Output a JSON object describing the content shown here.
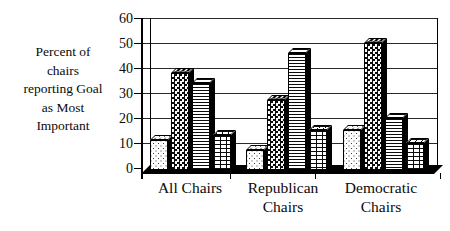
{
  "page": {
    "background": "#ffffff",
    "ink": "#000000"
  },
  "chart_data": {
    "type": "bar",
    "title": "",
    "ylabel": "Percent of chairs reporting Goal as Most Important",
    "ylabel_display": "Percent of\nchairs\nreporting Goal\nas Most\nImportant",
    "xlabel": "",
    "categories": [
      "All Chairs",
      "Republican Chairs",
      "Democratic Chairs"
    ],
    "category_display": [
      "All Chairs",
      "Republican\nChairs",
      "Democratic\nChairs"
    ],
    "series": [
      {
        "name": "dotted-pattern-bar",
        "pattern": "dots",
        "values": [
          12,
          8,
          16
        ]
      },
      {
        "name": "checkerboard-pattern-bar",
        "pattern": "checker",
        "values": [
          39,
          28,
          51
        ]
      },
      {
        "name": "horizontal-lines-pattern-bar",
        "pattern": "hlines",
        "values": [
          35,
          47,
          21
        ]
      },
      {
        "name": "brick-pattern-bar",
        "pattern": "brick",
        "values": [
          14,
          16,
          11
        ]
      }
    ],
    "ylim": [
      0,
      60
    ],
    "yticks": [
      0,
      10,
      20,
      30,
      40,
      50,
      60
    ],
    "grid": true,
    "legend_position": "none",
    "style_3d": true,
    "colors": {
      "bars": "monochrome-patterns",
      "lines": "#000000",
      "background": "#ffffff"
    }
  }
}
